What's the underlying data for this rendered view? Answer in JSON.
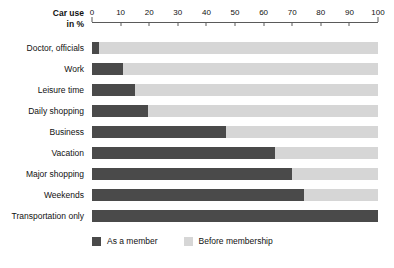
{
  "chart_data": {
    "type": "bar",
    "orientation": "horizontal",
    "stacked": true,
    "title": "",
    "xlabel": "Car use in %",
    "ylabel": "",
    "xlim": [
      0,
      100
    ],
    "grid": false,
    "legend_position": "bottom-left",
    "axis_title_line1": "Car use",
    "axis_title_line2": "in %",
    "tick_labels": [
      "0",
      "10",
      "20",
      "30",
      "40",
      "50",
      "60",
      "70",
      "80",
      "90",
      "100"
    ],
    "tick_values": [
      0,
      10,
      20,
      30,
      40,
      50,
      60,
      70,
      80,
      90,
      100
    ],
    "categories": [
      "Doctor, officials",
      "Work",
      "Leisure time",
      "Daily shopping",
      "Business",
      "Vacation",
      "Major shopping",
      "Weekends",
      "Transportation only"
    ],
    "series": [
      {
        "name": "As a member",
        "color": "#4a4a4a",
        "values": [
          2.5,
          11,
          15,
          19.5,
          47,
          64,
          70,
          74,
          100
        ]
      },
      {
        "name": "Before membership",
        "color": "#d6d6d6",
        "values": [
          97.5,
          89,
          85,
          80.5,
          53,
          36,
          30,
          26,
          0
        ]
      }
    ],
    "legend": [
      {
        "label": "As a member",
        "color": "#4a4a4a"
      },
      {
        "label": "Before membership",
        "color": "#d6d6d6"
      }
    ]
  }
}
